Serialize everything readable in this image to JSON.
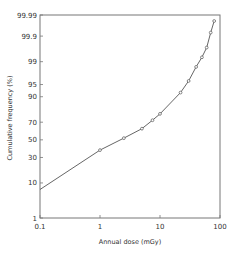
{
  "chart_data": {
    "type": "line",
    "title": "",
    "xlabel": "Annual dose (mGy)",
    "ylabel": "Cumulative frequency (%)",
    "xscale": "log",
    "yscale": "probability",
    "xlim": [
      0.1,
      100
    ],
    "ylim": [
      1,
      99.99
    ],
    "x_ticks": [
      "0.1",
      "1",
      "10",
      "100"
    ],
    "y_ticks": [
      "1",
      "10",
      "30",
      "50",
      "70",
      "90",
      "95",
      "99",
      "99.9",
      "99.99"
    ],
    "grid": false,
    "legend": null,
    "series": [
      {
        "name": "Cumulative frequency",
        "markers": "open-circle",
        "x": [
          0.1,
          1,
          2.5,
          5,
          7.5,
          10,
          22,
          30,
          40,
          50,
          60,
          70,
          80
        ],
        "y": [
          7,
          38,
          52,
          63,
          72,
          78,
          92,
          96,
          98.5,
          99.3,
          99.7,
          99.93,
          99.98
        ]
      }
    ]
  }
}
